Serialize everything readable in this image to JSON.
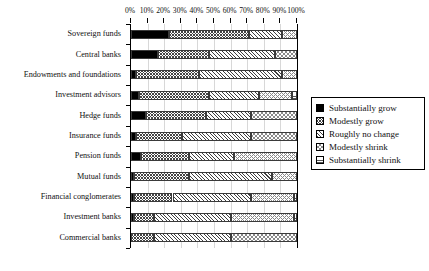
{
  "chart_data": {
    "type": "bar",
    "orientation": "horizontal",
    "stacked": true,
    "title": "",
    "subtitle": "",
    "xlabel": "",
    "ylabel": "",
    "xlim": [
      0,
      100
    ],
    "xunit": "%",
    "grid": true,
    "legend_position": "right",
    "xticks": [
      0,
      10,
      20,
      30,
      40,
      50,
      60,
      70,
      80,
      90,
      100
    ],
    "xtick_labels": [
      "0%",
      "10%",
      "20%",
      "30%",
      "40%",
      "50%",
      "60%",
      "70%",
      "80%",
      "90%",
      "100%"
    ],
    "categories": [
      "Sovereign funds",
      "Central banks",
      "Endowments and foundations",
      "Investment advisors",
      "Hedge funds",
      "Insurance funds",
      "Pension funds",
      "Mutual funds",
      "Financial conglomerates",
      "Investment banks",
      "Commercial banks"
    ],
    "series": [
      {
        "name": "Substantially grow",
        "pattern": "solid-black",
        "values": [
          23,
          16,
          3,
          5,
          9,
          3,
          6,
          2,
          2,
          2,
          0
        ]
      },
      {
        "name": "Modestly grow",
        "pattern": "crosshatch-fine",
        "values": [
          48,
          31,
          38,
          42,
          36,
          28,
          29,
          33,
          23,
          12,
          14
        ]
      },
      {
        "name": "Roughly no change",
        "pattern": "diagonal-hatch",
        "values": [
          20,
          40,
          50,
          30,
          27,
          41,
          27,
          50,
          47,
          46,
          46
        ]
      },
      {
        "name": "Modestly shrink",
        "pattern": "crosshatch-light",
        "values": [
          9,
          13,
          9,
          20,
          28,
          28,
          38,
          15,
          26,
          38,
          40
        ]
      },
      {
        "name": "Substantially shrink",
        "pattern": "horizontal-lines",
        "values": [
          0,
          0,
          0,
          3,
          0,
          0,
          0,
          0,
          2,
          2,
          0
        ]
      }
    ]
  },
  "legend": {
    "items": [
      {
        "label": "Substantially grow"
      },
      {
        "label": "Modestly grow"
      },
      {
        "label": "Roughly no change"
      },
      {
        "label": "Modestly shrink"
      },
      {
        "label": "Substantially shrink"
      }
    ]
  }
}
